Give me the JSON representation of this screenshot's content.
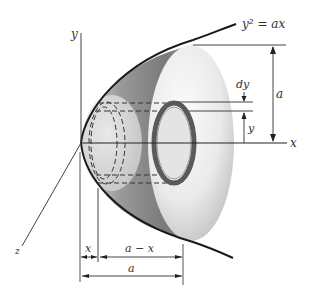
{
  "figure": {
    "curve_label": "y² = ax",
    "axes": {
      "x_label": "x",
      "y_label": "y",
      "z_label": "z"
    },
    "dimensions": {
      "height_label": "a",
      "shell_thickness_label": "dy",
      "shell_height_label": "y",
      "x_segment_label": "x",
      "remaining_segment_label": "a − x",
      "total_length_label": "a"
    },
    "colors": {
      "line": "#222222",
      "shade_dark": "#6e6e6e",
      "shade_light": "#f2f2f2",
      "ring": "#555555"
    }
  }
}
